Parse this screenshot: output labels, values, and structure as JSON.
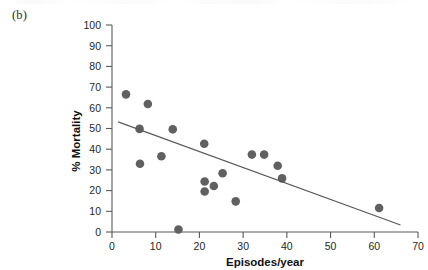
{
  "panel": {
    "label": "(b)"
  },
  "chart_data": {
    "type": "scatter",
    "title": "",
    "subtitle": "",
    "xlabel": "Episodes/year",
    "ylabel": "% Mortality",
    "xlim": [
      0,
      70
    ],
    "ylim": [
      0,
      100
    ],
    "xticks": [
      "0",
      "10",
      "20",
      "30",
      "40",
      "50",
      "60",
      "70"
    ],
    "xtick_values": [
      0,
      10,
      20,
      30,
      40,
      50,
      60,
      70
    ],
    "yticks": [
      "0",
      "10",
      "20",
      "30",
      "40",
      "50",
      "60",
      "70",
      "80",
      "90",
      "100"
    ],
    "ytick_values": [
      0,
      10,
      20,
      30,
      40,
      50,
      60,
      70,
      80,
      90,
      100
    ],
    "grid": false,
    "legend": null,
    "marker_color": "#606060",
    "line_color": "#595959",
    "series": [
      {
        "name": "Patients",
        "type": "scatter",
        "points": [
          {
            "x": 3.2,
            "y": 66.5
          },
          {
            "x": 6.3,
            "y": 49.8
          },
          {
            "x": 6.4,
            "y": 33.0
          },
          {
            "x": 8.2,
            "y": 61.8
          },
          {
            "x": 11.3,
            "y": 36.6
          },
          {
            "x": 13.9,
            "y": 49.6
          },
          {
            "x": 15.2,
            "y": 1.2
          },
          {
            "x": 21.1,
            "y": 42.6
          },
          {
            "x": 21.2,
            "y": 24.4
          },
          {
            "x": 21.2,
            "y": 19.6
          },
          {
            "x": 23.3,
            "y": 22.2
          },
          {
            "x": 25.3,
            "y": 28.4
          },
          {
            "x": 28.3,
            "y": 14.8
          },
          {
            "x": 32.0,
            "y": 37.4
          },
          {
            "x": 34.8,
            "y": 37.4
          },
          {
            "x": 37.9,
            "y": 32.0
          },
          {
            "x": 38.9,
            "y": 25.9
          },
          {
            "x": 61.1,
            "y": 11.6
          }
        ]
      },
      {
        "name": "Regression line",
        "type": "line",
        "points": [
          {
            "x": 1.4,
            "y": 53.2
          },
          {
            "x": 66.0,
            "y": 3.4
          }
        ]
      }
    ]
  }
}
